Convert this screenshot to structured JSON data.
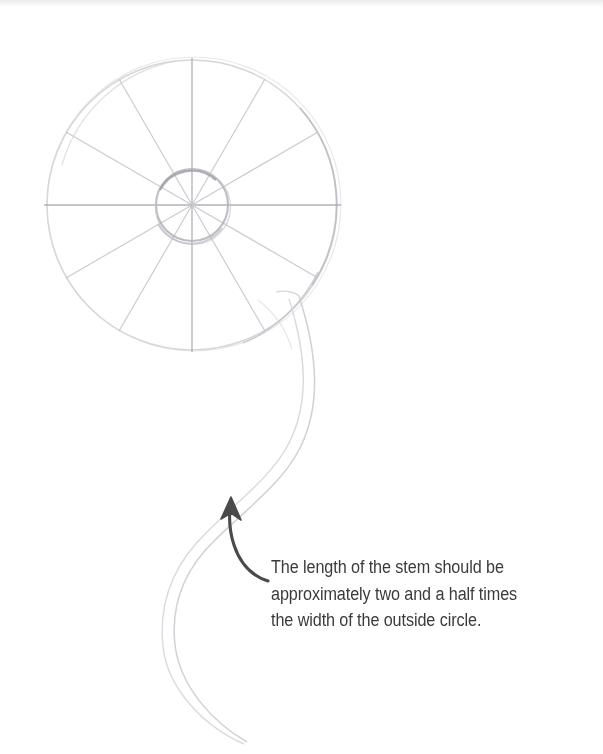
{
  "page": {
    "width": 603,
    "height": 754,
    "background_color": "#ffffff",
    "kind": "pencil-drawing-tutorial-page"
  },
  "caption": {
    "full_text": "The length of the stem should be approximately two and a half times the width of the outside circle.",
    "lines": [
      "The length of the stem should be",
      "approximately two and a half times",
      "the width of the outside circle."
    ],
    "text_color": "#3b3b3b"
  },
  "drawing": {
    "title": "flower head construction sketch with stem",
    "pencil_color": "#c9c9cc",
    "pencil_color_light": "#dcdce0",
    "pencil_color_dark": "#b4b4ba",
    "arrow_color": "#4a4a4a",
    "outer_circle": {
      "label": "outside circle",
      "center_x": 192,
      "center_y": 205,
      "radius": 145
    },
    "inner_circle": {
      "label": "inside circle",
      "center_x": 192,
      "center_y": 205,
      "radius": 36
    },
    "spokes": {
      "label": "radial guide lines",
      "count": 12,
      "angle_step_degrees": 30
    },
    "stem": {
      "label": "curved stem",
      "shape": "S-curve",
      "top_x": 300,
      "top_y": 300,
      "bottom_x": 246,
      "bottom_y": 742
    },
    "arrow": {
      "label": "measurement pointer arrow",
      "tip_x": 231,
      "tip_y": 498,
      "tail_x": 268,
      "tail_y": 581,
      "direction": "up"
    }
  }
}
